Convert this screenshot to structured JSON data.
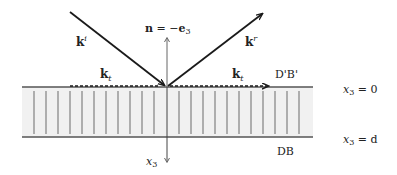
{
  "figure": {
    "width": 397,
    "height": 175,
    "colors": {
      "line": "#1a1a1a",
      "layer_fill": "#f1f1f1",
      "stripe": "#8a8a8a",
      "boundary": "#555555",
      "axis": "#666666",
      "text": "#222222",
      "muted_text": "#555555"
    }
  },
  "labels": {
    "incident_wave": "k",
    "incident_sup": "i",
    "reflected_wave": "k",
    "reflected_sup": "r",
    "normal_bold": "n",
    "normal_eq": " = −",
    "normal_e": "e",
    "normal_sub": "3",
    "tangential_left": "k",
    "tangential_left_sub": "t",
    "tangential_right": "k",
    "tangential_right_sub": "t",
    "top_boundary": "D'B'",
    "bottom_boundary": "DB",
    "axis": "x",
    "axis_sub": "3",
    "top_eq_var": "x",
    "top_eq_sub": "3",
    "top_eq_rhs": " = 0",
    "bottom_eq_var": "x",
    "bottom_eq_sub": "3",
    "bottom_eq_rhs": " = d"
  }
}
